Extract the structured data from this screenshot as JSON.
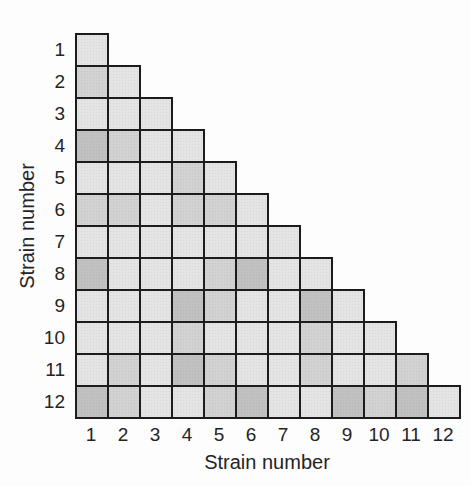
{
  "colors": {
    "background": "#fdfdfd",
    "cell_border": "#1c1c1c",
    "text": "#242424",
    "shade_levels": [
      "#e4e4e4",
      "#d2d2d2",
      "#c1c1c1"
    ]
  },
  "chart_data": {
    "type": "heatmap",
    "subtype": "lower-triangular pairwise similarity matrix, grayscale shading",
    "title": "",
    "xlabel": "Strain number",
    "ylabel": "Strain number",
    "x_tick_labels": [
      "1",
      "2",
      "3",
      "4",
      "5",
      "6",
      "7",
      "8",
      "9",
      "10",
      "11",
      "12"
    ],
    "y_tick_labels": [
      "1",
      "2",
      "3",
      "4",
      "5",
      "6",
      "7",
      "8",
      "9",
      "10",
      "11",
      "12"
    ],
    "legend_position": "none",
    "shade_scale": [
      {
        "level": 0,
        "name": "light",
        "color": "#e4e4e4"
      },
      {
        "level": 1,
        "name": "medium",
        "color": "#d2d2d2"
      },
      {
        "level": 2,
        "name": "dark",
        "color": "#c1c1c1"
      }
    ],
    "matrix": [
      [
        0
      ],
      [
        1,
        0
      ],
      [
        0,
        0,
        0
      ],
      [
        2,
        1,
        0,
        0
      ],
      [
        0,
        0,
        0,
        1,
        0
      ],
      [
        1,
        1,
        0,
        1,
        1,
        0
      ],
      [
        0,
        0,
        0,
        0,
        0,
        0,
        0
      ],
      [
        2,
        0,
        0,
        0,
        1,
        2,
        0,
        0
      ],
      [
        0,
        0,
        0,
        2,
        1,
        0,
        0,
        2,
        0
      ],
      [
        0,
        0,
        0,
        1,
        0,
        0,
        0,
        1,
        0,
        0
      ],
      [
        0,
        1,
        0,
        2,
        1,
        0,
        0,
        1,
        0,
        0,
        1
      ],
      [
        2,
        1,
        0,
        0,
        1,
        2,
        0,
        0,
        2,
        1,
        2,
        0
      ]
    ]
  }
}
